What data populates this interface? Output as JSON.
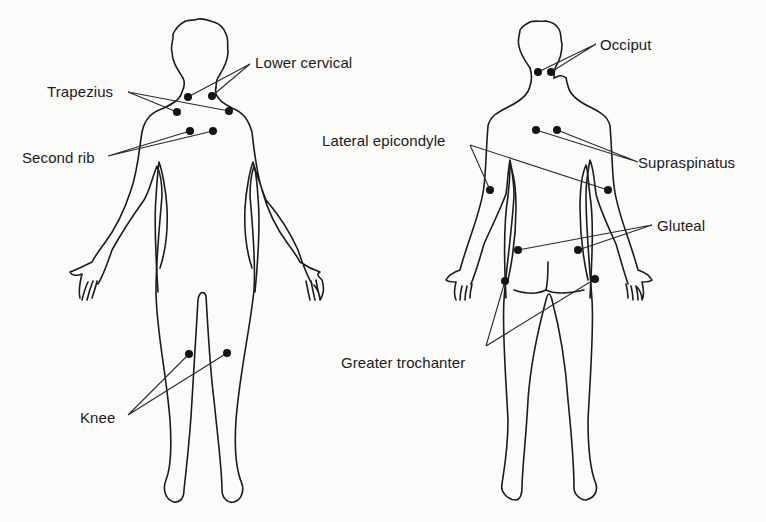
{
  "figure": {
    "views": [
      {
        "id": "front",
        "labels": [
          {
            "text": "Trapezius",
            "x": 47,
            "y": 86
          },
          {
            "text": "Lower cervical",
            "x": 254,
            "y": 55
          },
          {
            "text": "Second rib",
            "x": 22,
            "y": 152
          },
          {
            "text": "Knee",
            "x": 80,
            "y": 411
          }
        ],
        "points": [
          {
            "site": "Lower cervical",
            "side": "right",
            "x": 188,
            "y": 97
          },
          {
            "site": "Lower cervical",
            "side": "left",
            "x": 212,
            "y": 96
          },
          {
            "site": "Trapezius",
            "side": "right",
            "x": 177,
            "y": 112
          },
          {
            "site": "Trapezius",
            "side": "left",
            "x": 229,
            "y": 111
          },
          {
            "site": "Second rib",
            "side": "right",
            "x": 190,
            "y": 131
          },
          {
            "site": "Second rib",
            "side": "left",
            "x": 213,
            "y": 131
          },
          {
            "site": "Knee",
            "side": "right",
            "x": 189,
            "y": 354
          },
          {
            "site": "Knee",
            "side": "left",
            "x": 227,
            "y": 353
          }
        ]
      },
      {
        "id": "back",
        "labels": [
          {
            "text": "Occiput",
            "x": 600,
            "y": 40
          },
          {
            "text": "Lateral epicondyle",
            "x": 322,
            "y": 136
          },
          {
            "text": "Supraspinatus",
            "x": 638,
            "y": 156
          },
          {
            "text": "Gluteal",
            "x": 657,
            "y": 219
          },
          {
            "text": "Greater trochanter",
            "x": 341,
            "y": 355
          }
        ],
        "points": [
          {
            "site": "Occiput",
            "side": "left",
            "x": 538,
            "y": 72
          },
          {
            "site": "Occiput",
            "side": "right",
            "x": 551,
            "y": 72
          },
          {
            "site": "Supraspinatus",
            "side": "left",
            "x": 536,
            "y": 130
          },
          {
            "site": "Supraspinatus",
            "side": "right",
            "x": 557,
            "y": 130
          },
          {
            "site": "Lateral epicondyle",
            "side": "left",
            "x": 490,
            "y": 190
          },
          {
            "site": "Lateral epicondyle",
            "side": "right",
            "x": 608,
            "y": 190
          },
          {
            "site": "Gluteal",
            "side": "left",
            "x": 518,
            "y": 250
          },
          {
            "site": "Gluteal",
            "side": "right",
            "x": 578,
            "y": 250
          },
          {
            "site": "Greater trochanter",
            "side": "left",
            "x": 505,
            "y": 281
          },
          {
            "site": "Greater trochanter",
            "side": "right",
            "x": 595,
            "y": 279
          }
        ]
      }
    ]
  },
  "labels": {
    "trapezius": "Trapezius",
    "lower_cervical": "Lower cervical",
    "second_rib": "Second rib",
    "knee": "Knee",
    "occiput": "Occiput",
    "lateral_epicondyle": "Lateral epicondyle",
    "supraspinatus": "Supraspinatus",
    "gluteal": "Gluteal",
    "greater_trochanter": "Greater trochanter"
  },
  "colors": {
    "background": "#fbfbfa",
    "ink": "#1b1b1b"
  }
}
